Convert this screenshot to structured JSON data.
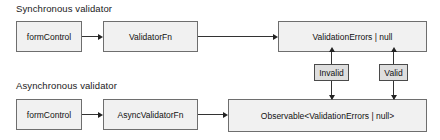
{
  "diagram": {
    "sections": [
      {
        "id": "sync",
        "label": "Synchronous validator"
      },
      {
        "id": "async",
        "label": "Asynchronous validator"
      }
    ],
    "nodes": [
      {
        "id": "sync-form-control",
        "label": "formControl"
      },
      {
        "id": "sync-validator-fn",
        "label": "ValidatorFn"
      },
      {
        "id": "sync-result",
        "label": "ValidationErrors | null"
      },
      {
        "id": "async-form-control",
        "label": "formControl"
      },
      {
        "id": "async-validator-fn",
        "label": "AsyncValidatorFn"
      },
      {
        "id": "async-result",
        "label": "Observable<ValidationErrors | null>"
      }
    ],
    "tags": [
      {
        "id": "invalid",
        "label": "Invalid"
      },
      {
        "id": "valid",
        "label": "Valid"
      }
    ],
    "colors": {
      "node_fill": "#f1f1f1",
      "node_border": "#6e6e6e",
      "tag_fill": "#dedede",
      "tag_border": "#4a4a4a",
      "edge": "#333333",
      "background": "#ffffff",
      "text": "#111111"
    }
  }
}
